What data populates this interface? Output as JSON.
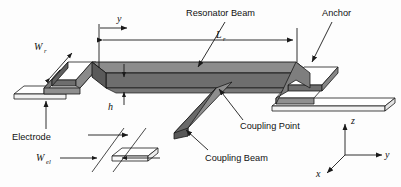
{
  "figure": {
    "type": "3d-perspective-diagram",
    "background_color": "#fdfdfd",
    "line_color": "#1a1a1a"
  },
  "colors": {
    "beam_top": "#8c8c8c",
    "beam_front": "#6e6e6e",
    "beam_dark": "#5a5a5a",
    "electrode_fill": "#ffffff",
    "anchor_side": "#9a9a9a",
    "coupling_fill": "#7d7d7d",
    "outline": "#1a1a1a"
  },
  "labels": {
    "resonator_beam": "Resonator Beam",
    "anchor": "Anchor",
    "electrode": "Electrode",
    "coupling_point": "Coupling Point",
    "coupling_beam": "Coupling Beam"
  },
  "dimensions": {
    "y_axis_ref": {
      "symbol": "y",
      "subscript": ""
    },
    "length_resonator": {
      "symbol": "L",
      "subscript": "r"
    },
    "width_resonator": {
      "symbol": "W",
      "subscript": "r"
    },
    "width_electrode": {
      "symbol": "W",
      "subscript": "el"
    },
    "height": {
      "symbol": "h",
      "subscript": ""
    }
  },
  "axes_triad": {
    "x": "x",
    "y": "y",
    "z": "z",
    "origin": {
      "x": 345,
      "y": 155
    }
  }
}
